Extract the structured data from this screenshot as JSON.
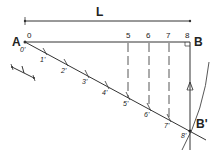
{
  "diagram": {
    "dimension_label": "L",
    "point_a": "A",
    "point_b": "B",
    "point_b_prime": "B'",
    "top_division_labels": [
      "0",
      "5",
      "6",
      "7",
      "8"
    ],
    "diagonal_division_labels": [
      "0'",
      "1'",
      "2'",
      "3'",
      "4'",
      "5'",
      "6'",
      "7'",
      "8'"
    ],
    "unit_scale_label": "1",
    "colors": {
      "line": "#333333",
      "background": "#ffffff"
    }
  }
}
